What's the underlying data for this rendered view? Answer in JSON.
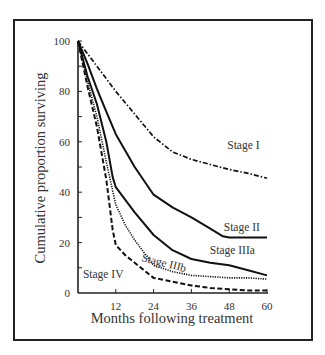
{
  "chart_data": {
    "type": "line",
    "title": "",
    "xlabel": "Months following treatment",
    "ylabel": "Cumulative proportion surviving",
    "xlim": [
      0,
      60
    ],
    "ylim": [
      0,
      100
    ],
    "x_ticks": [
      12,
      24,
      36,
      48,
      60
    ],
    "x_tick_labels": [
      "12",
      "24",
      "36",
      "48",
      "60"
    ],
    "y_ticks": [
      0,
      20,
      40,
      60,
      80,
      100
    ],
    "y_tick_labels": [
      "0",
      "20",
      "40",
      "60",
      "80",
      "100"
    ],
    "y_minor_ticks": [
      10,
      30,
      50,
      70,
      90
    ],
    "grid": false,
    "legend": "inline labels",
    "x": [
      0,
      3,
      6,
      9,
      12,
      18,
      24,
      30,
      36,
      42,
      48,
      54,
      60
    ],
    "series": [
      {
        "name": "Stage I",
        "style": "dash-dot",
        "x": [
          0,
          6,
          12,
          18,
          24,
          30,
          36,
          42,
          48,
          54,
          60
        ],
        "values": [
          100,
          90,
          80,
          71,
          62,
          56,
          53,
          51,
          49,
          47.5,
          45.5
        ]
      },
      {
        "name": "Stage II",
        "style": "solid",
        "x": [
          0,
          3,
          6,
          9,
          12,
          18,
          24,
          30,
          36,
          42,
          46,
          48,
          54,
          60
        ],
        "values": [
          100,
          91,
          81,
          72,
          63,
          50,
          39,
          34,
          30,
          25.5,
          22.5,
          22,
          22,
          22
        ]
      },
      {
        "name": "Stage IIIa",
        "style": "solid",
        "x": [
          0,
          3,
          6,
          9,
          11,
          12,
          15,
          18,
          24,
          30,
          36,
          42,
          48,
          54,
          60
        ],
        "values": [
          100,
          86,
          75,
          60,
          46,
          42,
          37,
          32,
          23,
          17,
          13.5,
          12,
          11,
          9,
          7
        ]
      },
      {
        "name": "Stage IIIb",
        "style": "dotted",
        "x": [
          0,
          3,
          6,
          9,
          12,
          15,
          18,
          21,
          24,
          30,
          36,
          42,
          48,
          54,
          60
        ],
        "values": [
          100,
          84,
          70,
          52,
          35,
          27,
          21,
          16,
          11,
          8.5,
          7,
          6.5,
          6,
          6,
          5.5
        ]
      },
      {
        "name": "Stage IV",
        "style": "dashed",
        "x": [
          0,
          3,
          6,
          9,
          11,
          12,
          15,
          18,
          24,
          30,
          36,
          42,
          48,
          54,
          60
        ],
        "values": [
          100,
          82,
          66,
          45,
          25,
          19,
          15,
          12,
          6,
          4.5,
          3,
          2,
          1.5,
          1,
          1
        ]
      }
    ],
    "annotations": [
      {
        "text": "Stage I",
        "x_month": 52.5,
        "y_value": 57
      },
      {
        "text": "Stage II",
        "x_month": 52,
        "y_value": 24.5
      },
      {
        "text": "Stage IIIa",
        "x_month": 49,
        "y_value": 15.5
      },
      {
        "text": "Stage IIIb",
        "x_month": 27,
        "y_value": 10.5,
        "rotate": 14
      },
      {
        "text": "Stage IV",
        "x_month": 8,
        "y_value": 6
      }
    ]
  }
}
